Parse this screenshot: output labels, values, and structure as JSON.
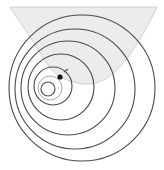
{
  "diagram": {
    "type": "wavefront-circles",
    "width": 164,
    "height": 170,
    "background": "#ffffff",
    "colors": {
      "wavefront": "#4a4a4a",
      "faint_wavefront": "#a8a8a8",
      "cone_fill": "#ececec",
      "cone_edge": "#c8c8c8",
      "source": "#111111",
      "marker": "#555555"
    },
    "shaded_region": {
      "path": "M10,7 L157,7 C150,22 138,45 124,62 C112,77 100,85 84,84 C74,83 66,80 60,77 C50,70 44,60 36,46 C26,30 16,17 10,7 Z"
    },
    "circles": [
      {
        "cx": 82,
        "cy": 88,
        "r": 73,
        "style": "dark"
      },
      {
        "cx": 75,
        "cy": 89,
        "r": 60,
        "style": "dark"
      },
      {
        "cx": 68,
        "cy": 88,
        "r": 47,
        "style": "dark"
      },
      {
        "cx": 61,
        "cy": 87,
        "r": 33,
        "style": "dark"
      },
      {
        "cx": 53,
        "cy": 86,
        "r": 19,
        "style": "dark"
      },
      {
        "cx": 50,
        "cy": 88,
        "r": 12,
        "style": "faint"
      },
      {
        "cx": 48,
        "cy": 89,
        "r": 7,
        "style": "dark"
      }
    ],
    "source": {
      "x": 60,
      "y": 77,
      "r": 2.6
    },
    "marker": {
      "x": 67,
      "y": 70
    }
  }
}
